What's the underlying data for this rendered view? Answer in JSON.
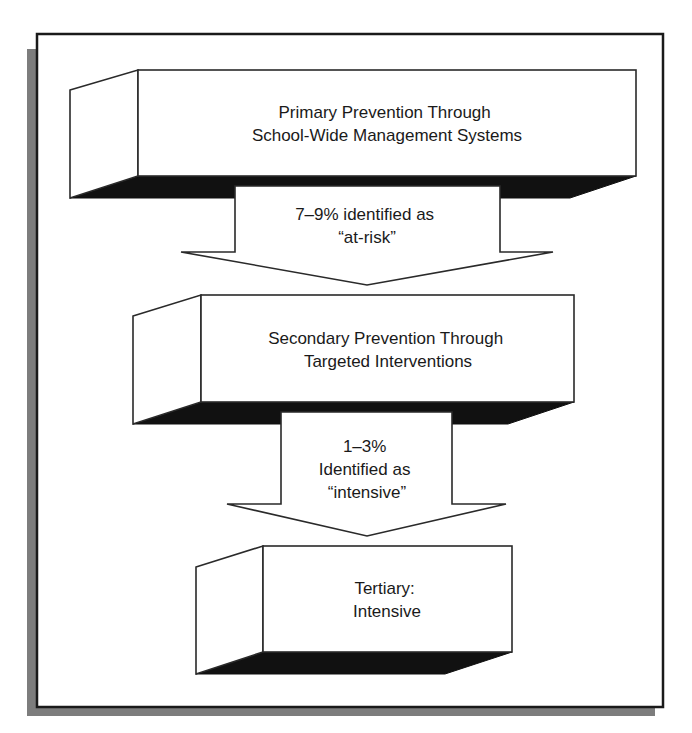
{
  "diagram": {
    "type": "flowchart",
    "colors": {
      "shadow": "#111111",
      "frame_shadow": "#7d7d7d",
      "stroke": "#2a2a2a",
      "background": "#ffffff"
    },
    "levels": [
      {
        "id": "primary",
        "lines": [
          "Primary Prevention Through",
          "School-Wide Management Systems"
        ]
      },
      {
        "id": "secondary",
        "lines": [
          "Secondary Prevention Through",
          "Targeted Interventions"
        ]
      },
      {
        "id": "tertiary",
        "lines": [
          "Tertiary:",
          "Intensive"
        ]
      }
    ],
    "arrows": [
      {
        "from": "primary",
        "to": "secondary",
        "lines": [
          "7–9% identified as",
          "“at-risk”"
        ]
      },
      {
        "from": "secondary",
        "to": "tertiary",
        "lines": [
          "1–3%",
          "Identified as",
          "“intensive”"
        ]
      }
    ]
  }
}
